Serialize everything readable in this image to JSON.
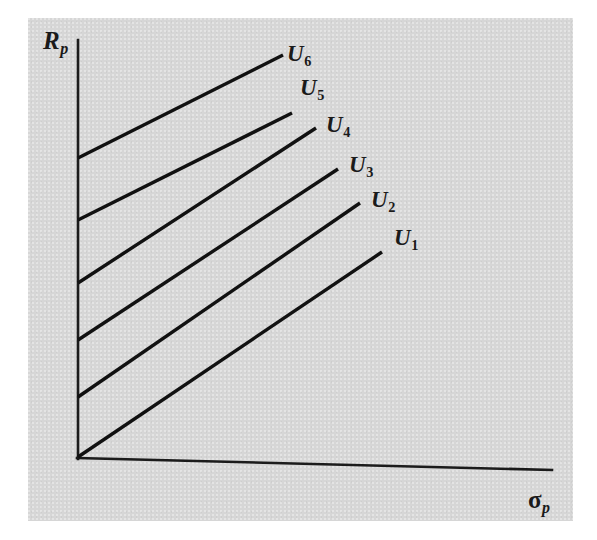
{
  "figure": {
    "background_color": "#ffffff",
    "panel_color": "#d6d6d6",
    "ink_color": "#111111",
    "width": 597,
    "height": 540
  },
  "axes": {
    "y_axis_label": "R",
    "y_axis_subscript": "p",
    "x_axis_label": "σ",
    "x_axis_subscript": "p"
  },
  "curve_labels": [
    {
      "base": "U",
      "sub": "6"
    },
    {
      "base": "U",
      "sub": "5"
    },
    {
      "base": "U",
      "sub": "4"
    },
    {
      "base": "U",
      "sub": "3"
    },
    {
      "base": "U",
      "sub": "2"
    },
    {
      "base": "U",
      "sub": "1"
    }
  ],
  "chart_data": {
    "type": "line",
    "title": "",
    "subtitle": "",
    "xlabel": "σp",
    "ylabel": "Rp",
    "xlim": [
      0,
      100
    ],
    "ylim": [
      0,
      100
    ],
    "grid": false,
    "legend": "inline-end-labels",
    "axis_ticks": {
      "x": [],
      "y": []
    },
    "annotations": [
      "Indifference curves of increasing utility: U1 lowest, U6 highest",
      "All curves are upward sloping straight segments with equal slope"
    ],
    "series": [
      {
        "name": "U6",
        "label": "U6",
        "points": [
          {
            "x": 0,
            "y": 79
          },
          {
            "x": 41,
            "y": 106
          }
        ],
        "pixel_start": [
          78,
          158
        ],
        "pixel_end": [
          283,
          55
        ]
      },
      {
        "name": "U5",
        "label": "U5",
        "points": [
          {
            "x": 0,
            "y": 64
          },
          {
            "x": 43,
            "y": 92
          }
        ],
        "pixel_start": [
          78,
          220
        ],
        "pixel_end": [
          292,
          113
        ]
      },
      {
        "name": "U4",
        "label": "U4",
        "points": [
          {
            "x": 0,
            "y": 49
          },
          {
            "x": 48,
            "y": 80
          }
        ],
        "pixel_start": [
          78,
          283
        ],
        "pixel_end": [
          316,
          128
        ]
      },
      {
        "name": "U3",
        "label": "U3",
        "points": [
          {
            "x": 0,
            "y": 35
          },
          {
            "x": 52,
            "y": 68
          }
        ],
        "pixel_start": [
          78,
          340
        ],
        "pixel_end": [
          338,
          169
        ]
      },
      {
        "name": "U2",
        "label": "U2",
        "points": [
          {
            "x": 0,
            "y": 21
          },
          {
            "x": 57,
            "y": 56
          }
        ],
        "pixel_start": [
          78,
          397
        ],
        "pixel_end": [
          360,
          203
        ]
      },
      {
        "name": "U1",
        "label": "U1",
        "points": [
          {
            "x": 0,
            "y": 6
          },
          {
            "x": 62,
            "y": 43
          }
        ],
        "pixel_start": [
          78,
          457
        ],
        "pixel_end": [
          382,
          252
        ]
      }
    ]
  }
}
